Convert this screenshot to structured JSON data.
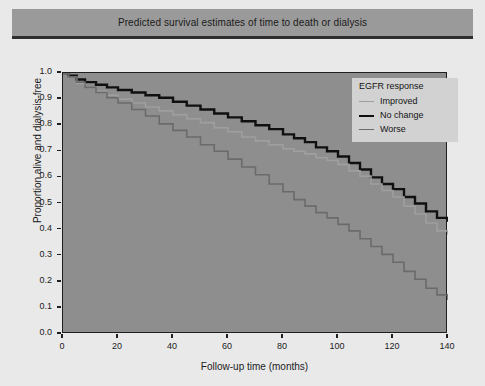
{
  "figure": {
    "title": "Predicted survival estimates of time to death or dialysis"
  },
  "legend": {
    "title": "EGFR response",
    "entries": [
      {
        "label": "Improved",
        "color": "#9f9f9f",
        "width": 1.6
      },
      {
        "label": "No change",
        "color": "#101010",
        "width": 2.4
      },
      {
        "label": "Worse",
        "color": "#6b6b6b",
        "width": 1.6
      }
    ]
  },
  "axes": {
    "y_ticks": [
      "1.0",
      "0.9",
      "0.8",
      "0.7",
      "0.6",
      "0.5",
      "0.4",
      "0.3",
      "0.2",
      "0.1",
      "0.0"
    ],
    "x_ticks": [
      "0",
      "20",
      "40",
      "60",
      "80",
      "100",
      "120",
      "140"
    ],
    "ylabel": "Proportion alive and dialysis-free",
    "xlabel": "Follow-up time (months)"
  },
  "chart_data": {
    "type": "line",
    "title": "Predicted survival estimates of time to death or dialysis",
    "xlabel": "Follow-up time (months)",
    "ylabel": "Proportion alive and dialysis-free",
    "xlim": [
      0,
      140
    ],
    "ylim": [
      0.0,
      1.0
    ],
    "xticks": [
      0,
      20,
      40,
      60,
      80,
      100,
      120,
      140
    ],
    "yticks": [
      0.0,
      0.1,
      0.2,
      0.3,
      0.4,
      0.5,
      0.6,
      0.7,
      0.8,
      0.9,
      1.0
    ],
    "grid": false,
    "legend_position": "upper right",
    "legend_title": "EGFR response",
    "step": "post",
    "series": [
      {
        "name": "No change",
        "color": "#101010",
        "linewidth": 2.4,
        "x": [
          0,
          2,
          5,
          8,
          12,
          16,
          20,
          25,
          30,
          35,
          40,
          45,
          50,
          55,
          60,
          65,
          70,
          75,
          80,
          84,
          88,
          92,
          96,
          100,
          104,
          108,
          112,
          116,
          120,
          124,
          128,
          132,
          136,
          140
        ],
        "y": [
          1.0,
          0.99,
          0.975,
          0.965,
          0.955,
          0.945,
          0.935,
          0.925,
          0.915,
          0.905,
          0.89,
          0.875,
          0.86,
          0.845,
          0.83,
          0.815,
          0.8,
          0.785,
          0.765,
          0.75,
          0.735,
          0.715,
          0.7,
          0.68,
          0.655,
          0.63,
          0.6,
          0.575,
          0.555,
          0.525,
          0.5,
          0.47,
          0.445,
          0.43
        ]
      },
      {
        "name": "Improved",
        "color": "#9f9f9f",
        "linewidth": 1.6,
        "x": [
          0,
          2,
          5,
          8,
          12,
          16,
          20,
          25,
          30,
          35,
          40,
          45,
          50,
          55,
          60,
          65,
          70,
          75,
          80,
          84,
          88,
          92,
          96,
          100,
          104,
          108,
          112,
          116,
          120,
          124,
          128,
          132,
          136,
          140
        ],
        "y": [
          1.0,
          0.985,
          0.96,
          0.945,
          0.93,
          0.915,
          0.9,
          0.885,
          0.87,
          0.855,
          0.84,
          0.825,
          0.81,
          0.79,
          0.775,
          0.755,
          0.74,
          0.725,
          0.71,
          0.7,
          0.69,
          0.675,
          0.665,
          0.65,
          0.625,
          0.605,
          0.575,
          0.55,
          0.525,
          0.49,
          0.46,
          0.425,
          0.395,
          0.38
        ]
      },
      {
        "name": "Worse",
        "color": "#6b6b6b",
        "linewidth": 1.6,
        "x": [
          0,
          2,
          5,
          8,
          12,
          16,
          20,
          25,
          30,
          35,
          40,
          45,
          50,
          55,
          60,
          65,
          70,
          75,
          80,
          84,
          88,
          92,
          96,
          100,
          104,
          108,
          112,
          116,
          120,
          124,
          128,
          132,
          136,
          140
        ],
        "y": [
          1.0,
          0.985,
          0.965,
          0.945,
          0.925,
          0.905,
          0.885,
          0.86,
          0.835,
          0.805,
          0.78,
          0.755,
          0.725,
          0.7,
          0.67,
          0.64,
          0.61,
          0.575,
          0.545,
          0.515,
          0.49,
          0.465,
          0.445,
          0.42,
          0.395,
          0.365,
          0.335,
          0.305,
          0.275,
          0.24,
          0.21,
          0.175,
          0.15,
          0.13
        ]
      }
    ]
  }
}
